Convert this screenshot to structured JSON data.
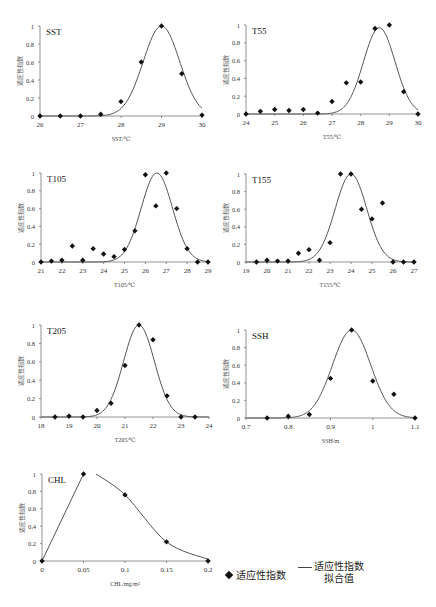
{
  "y_label": "适应性指数",
  "legend": {
    "points_label": "适应性指数",
    "curve_label_line1": "适应性指数",
    "curve_label_line2": "拟合值"
  },
  "caption_partial": "适应性指数曲线",
  "chart_data": [
    {
      "type": "scatter+line",
      "title": "SST",
      "xlabel": "SST/℃",
      "ylabel": "适应性指数",
      "xlim": [
        26,
        30
      ],
      "ylim": [
        0,
        1
      ],
      "xticks": [
        "26",
        "27",
        "28",
        "29",
        "30"
      ],
      "yticks": [
        "0",
        "0.2",
        "0.4",
        "0.6",
        "0.8",
        "1"
      ],
      "points": {
        "x": [
          26,
          26.5,
          27,
          27.5,
          28,
          28.5,
          29,
          29.5,
          30
        ],
        "y": [
          0,
          0,
          0,
          0.02,
          0.16,
          0.6,
          1.0,
          0.47,
          0.01
        ]
      },
      "fit": {
        "mu": 29.0,
        "sigma": 0.45
      }
    },
    {
      "type": "scatter+line",
      "title": "T55",
      "xlabel": "T55/℃",
      "ylabel": "适应性指数",
      "xlim": [
        24,
        30
      ],
      "ylim": [
        0,
        1
      ],
      "xticks": [
        "24",
        "25",
        "26",
        "27",
        "28",
        "29",
        "30"
      ],
      "yticks": [
        "0",
        "0.2",
        "0.4",
        "0.6",
        "0.8",
        "1"
      ],
      "points": {
        "x": [
          24,
          24.5,
          25,
          25.5,
          26,
          26.5,
          27,
          27.5,
          28,
          28.5,
          29,
          29.5,
          30
        ],
        "y": [
          0,
          0.03,
          0.05,
          0.04,
          0.05,
          0.01,
          0.14,
          0.35,
          0.36,
          0.96,
          1.0,
          0.25,
          0
        ]
      },
      "fit": {
        "mu": 28.65,
        "sigma": 0.55,
        "peak": 0.97
      }
    },
    {
      "type": "scatter+line",
      "title": "T105",
      "xlabel": "T105/℃",
      "ylabel": "适应性指数",
      "xlim": [
        21,
        29
      ],
      "ylim": [
        0,
        1
      ],
      "xticks": [
        "21",
        "22",
        "23",
        "24",
        "25",
        "26",
        "27",
        "28",
        "29"
      ],
      "yticks": [
        "0",
        "0.2",
        "0.4",
        "0.6",
        "0.8",
        "1"
      ],
      "points": {
        "x": [
          21,
          21.5,
          22,
          22.5,
          23,
          23.5,
          24,
          24.5,
          25,
          25.5,
          26,
          26.5,
          27,
          27.5,
          28,
          28.5,
          29
        ],
        "y": [
          0,
          0.01,
          0.02,
          0.18,
          0.02,
          0.15,
          0.09,
          0.06,
          0.14,
          0.35,
          0.98,
          0.63,
          1.0,
          0.6,
          0.15,
          0,
          0
        ]
      },
      "fit": {
        "mu": 26.55,
        "sigma": 0.75
      }
    },
    {
      "type": "scatter+line",
      "title": "T155",
      "xlabel": "T155/℃",
      "ylabel": "适应性指数",
      "xlim": [
        19,
        27
      ],
      "ylim": [
        0,
        1
      ],
      "xticks": [
        "19",
        "20",
        "21",
        "22",
        "23",
        "24",
        "25",
        "26",
        "27"
      ],
      "yticks": [
        "0",
        "0.2",
        "0.4",
        "0.6",
        "0.8",
        "1"
      ],
      "points": {
        "x": [
          19.5,
          20,
          20.5,
          21,
          21.5,
          22,
          22.5,
          23,
          23.5,
          24,
          24.5,
          25,
          25.5,
          26,
          26.5,
          27
        ],
        "y": [
          0,
          0.02,
          0.01,
          0.01,
          0.1,
          0.14,
          0.02,
          0.22,
          1.0,
          1.0,
          0.6,
          0.49,
          0.67,
          0,
          0,
          0
        ]
      },
      "fit": {
        "mu": 24.0,
        "sigma": 0.75
      }
    },
    {
      "type": "scatter+line",
      "title": "T205",
      "xlabel": "T205/℃",
      "ylabel": "适应性指数",
      "xlim": [
        18,
        24
      ],
      "ylim": [
        0,
        1
      ],
      "xticks": [
        "18",
        "19",
        "20",
        "21",
        "22",
        "23",
        "24"
      ],
      "yticks": [
        "0",
        "0.2",
        "0.4",
        "0.6",
        "0.8",
        "1"
      ],
      "points": {
        "x": [
          18.5,
          19,
          19.5,
          20,
          20.5,
          21,
          21.5,
          22,
          22.5,
          23,
          23.5
        ],
        "y": [
          0,
          0.01,
          0,
          0.07,
          0.15,
          0.56,
          1.0,
          0.84,
          0.23,
          0,
          0
        ]
      },
      "fit": {
        "mu": 21.5,
        "sigma": 0.55
      }
    },
    {
      "type": "scatter+line",
      "title": "SSH",
      "xlabel": "SSH/m",
      "ylabel": "适应性指数",
      "xlim": [
        0.7,
        1.1
      ],
      "ylim": [
        0,
        1
      ],
      "xticks": [
        "0.7",
        "0.8",
        "0.9",
        "1",
        "1.1"
      ],
      "yticks": [
        "0",
        "0.2",
        "0.4",
        "0.6",
        "0.8",
        "1"
      ],
      "points": {
        "x": [
          0.75,
          0.8,
          0.85,
          0.9,
          0.95,
          1.0,
          1.05,
          1.1
        ],
        "y": [
          0,
          0.02,
          0.04,
          0.45,
          1.0,
          0.42,
          0.27,
          0
        ]
      },
      "fit": {
        "mu": 0.95,
        "sigma": 0.045
      }
    },
    {
      "type": "scatter+line",
      "title": "CHL",
      "xlabel": "CHL/mg/m³",
      "ylabel": "适应性指数",
      "xlim": [
        0,
        0.2
      ],
      "ylim": [
        0,
        1
      ],
      "xticks": [
        "0",
        "0.05",
        "0.1",
        "0.15",
        "0.2"
      ],
      "yticks": [
        "0",
        "0.2",
        "0.4",
        "0.6",
        "0.8",
        "1"
      ],
      "points": {
        "x": [
          0,
          0.05,
          0.1,
          0.15,
          0.2
        ],
        "y": [
          0,
          1.0,
          0.76,
          0.22,
          0
        ]
      },
      "fit": {
        "type": "piecewise",
        "segments": [
          [
            [
              0,
              0
            ],
            [
              0.05,
              1.0
            ]
          ],
          [
            [
              0.065,
              1.0
            ],
            [
              0.1,
              0.76
            ],
            [
              0.15,
              0.22
            ],
            [
              0.2,
              0.02
            ]
          ]
        ]
      }
    }
  ],
  "panels_layout": [
    {
      "left": 40,
      "top": 26,
      "width": 162,
      "height": 90
    },
    {
      "left": 246,
      "top": 25,
      "width": 172,
      "height": 89
    },
    {
      "left": 41,
      "top": 173,
      "width": 167,
      "height": 89
    },
    {
      "left": 246,
      "top": 174,
      "width": 168,
      "height": 88
    },
    {
      "left": 41,
      "top": 325,
      "width": 168,
      "height": 92
    },
    {
      "left": 246,
      "top": 330,
      "width": 169,
      "height": 88
    },
    {
      "left": 42,
      "top": 474,
      "width": 166,
      "height": 87
    }
  ]
}
